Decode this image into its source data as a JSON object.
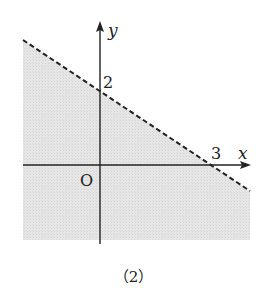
{
  "figure": {
    "caption": "（2）",
    "axes": {
      "x_label": "x",
      "y_label": "y",
      "origin_label": "O"
    },
    "ticks": {
      "y_intercept_label": "2",
      "x_intercept_label": "3"
    },
    "boundary": {
      "equation": "2x + 3y = 6",
      "style": "dashed",
      "x_intercept": 3,
      "y_intercept": 2
    },
    "shaded_region": "below boundary line (2x + 3y < 6)",
    "colors": {
      "shade": "#e3e3e3",
      "line": "#222222",
      "background": "#ffffff"
    }
  }
}
